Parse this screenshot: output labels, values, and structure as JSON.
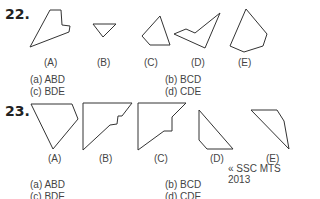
{
  "questions": [
    {
      "number": "22.",
      "figure_labels": [
        "(A)",
        "(B)",
        "(C)",
        "(D)",
        "(E)"
      ],
      "options": {
        "a": "(a) ABD",
        "b": "(b) BCD",
        "c": "(c) BDE",
        "d": "(d) CDE"
      }
    },
    {
      "number": "23.",
      "figure_labels": [
        "(A)",
        "(B)",
        "(C)",
        "(D)",
        "(E)"
      ],
      "options": {
        "a": "(a) ABD",
        "b": "(b) BCD",
        "c": "(c) BDE",
        "d": "(d) CDE"
      },
      "source": "« SSC MTS 2013"
    }
  ]
}
